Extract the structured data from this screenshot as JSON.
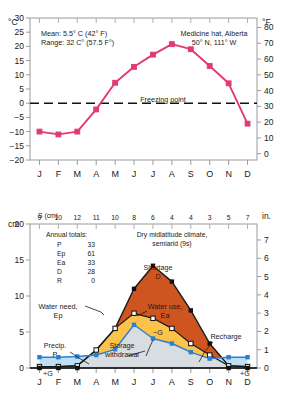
{
  "station": {
    "name": "Medicine hat, Alberta",
    "coords": "50° N, 111° W",
    "mean": "Mean: 5.5° C (42° F)",
    "range": "Range: 32 C° (57.5 F°)",
    "climate_line1": "Dry midlatitude climate,",
    "climate_line2": "semiarid (9s)"
  },
  "labels": {
    "c_unit": "°C",
    "f_unit": "°F",
    "cm_unit": "cm",
    "in_unit": "in.",
    "s_header": "S (cm)",
    "freezing": "Freezing point",
    "water_need_1": "Water need,",
    "water_need_2": "Ep",
    "water_use_1": "Water use,",
    "water_use_2": "Ea",
    "shortage_1": "Shortage",
    "shortage_2": "D",
    "precip_1": "Precip.",
    "precip_2": "P",
    "storage_1": "Storage",
    "storage_2": "withdrawal",
    "recharge": "Recharge",
    "minus_g": "−G",
    "plus_g": "+G",
    "totals_title": "Annual totals:"
  },
  "totals": [
    {
      "key": "P",
      "value": "33"
    },
    {
      "key": "Ep",
      "value": "61"
    },
    {
      "key": "Ea",
      "value": "33"
    },
    {
      "key": "D",
      "value": "28"
    },
    {
      "key": "R",
      "value": "0"
    }
  ],
  "colors": {
    "temperature_line": "#e23b6e",
    "shortage_fill": "#cf5520",
    "water_use_fill": "#fcc34a",
    "storage_fill": "#d8dde2",
    "precip_fill": "#bfe0f2",
    "precip_line": "#2a7fd4",
    "axis": "#9a9a9a",
    "baseline": "#000000"
  },
  "chart_data": [
    {
      "type": "line",
      "title": "Medicine hat, Alberta — Monthly mean temperature",
      "xlabel": "",
      "ylabel": "°C",
      "y2label": "°F",
      "categories": [
        "J",
        "F",
        "M",
        "A",
        "M",
        "J",
        "J",
        "A",
        "S",
        "O",
        "N",
        "D"
      ],
      "values": [
        -10,
        -11,
        -10,
        -2.2,
        7.2,
        12.8,
        17.1,
        20.8,
        19.0,
        13.1,
        7.0,
        -2.5
      ],
      "values_last": -7.2,
      "series": [
        {
          "name": "Mean monthly temperature (°C)",
          "values": [
            -10,
            -11,
            -10,
            -2.2,
            7.2,
            12.8,
            17.1,
            20.8,
            19.0,
            13.1,
            7.0,
            -7.2
          ]
        }
      ],
      "ylim": [
        -20,
        30
      ],
      "yticks": [
        -20,
        -15,
        -10,
        -5,
        0,
        5,
        10,
        15,
        20,
        25,
        30
      ],
      "y2lim": [
        -4,
        86
      ],
      "y2ticks": [
        0,
        10,
        20,
        30,
        40,
        50,
        60,
        70,
        80
      ],
      "annotations": [
        {
          "text": "Freezing point",
          "y": 0
        },
        {
          "text": "Mean: 5.5° C (42° F)"
        },
        {
          "text": "Range: 32 C° (57.5 F°)"
        }
      ],
      "grid": false,
      "legend": "none"
    },
    {
      "type": "area",
      "title": "Soil water balance",
      "xlabel": "",
      "ylabel": "cm",
      "y2label": "in.",
      "categories": [
        "J",
        "F",
        "M",
        "A",
        "M",
        "J",
        "J",
        "A",
        "S",
        "O",
        "N",
        "D"
      ],
      "ylim": [
        0,
        20
      ],
      "yticks": [
        0,
        5,
        10,
        15,
        20
      ],
      "y2lim": [
        0,
        7.87
      ],
      "y2ticks": [
        0,
        1,
        2,
        3,
        4,
        5,
        6,
        7
      ],
      "storage_row_label": "S (cm)",
      "storage_row": [
        9,
        10,
        12,
        11,
        10,
        8,
        6,
        4,
        4,
        3,
        5,
        7
      ],
      "series": [
        {
          "name": "Water need, Ep",
          "values": [
            0.2,
            0.2,
            0.3,
            2.5,
            5.5,
            11.0,
            14.2,
            12.0,
            8.0,
            3.4,
            0.3,
            0.2
          ]
        },
        {
          "name": "Water use, Ea",
          "values": [
            0.2,
            0.2,
            0.3,
            2.5,
            5.5,
            7.6,
            6.9,
            5.5,
            3.4,
            1.8,
            0.3,
            0.2
          ]
        },
        {
          "name": "Precipitation, P",
          "values": [
            1.5,
            1.5,
            1.6,
            1.8,
            2.6,
            6.0,
            4.1,
            3.4,
            2.2,
            1.3,
            1.5,
            1.5
          ]
        }
      ],
      "annual_totals": {
        "P": 33,
        "Ep": 61,
        "Ea": 33,
        "D": 28,
        "R": 0
      },
      "recharge_months": [
        "J",
        "F",
        "M",
        "N",
        "D"
      ],
      "grid": false,
      "legend": "inline-annotations"
    }
  ]
}
